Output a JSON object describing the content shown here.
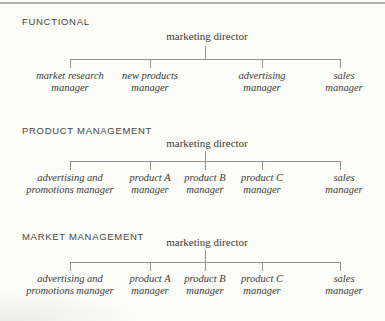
{
  "figure_title": "marketing department organization structures",
  "colors": {
    "background": "#fcfcf9",
    "line": "#94948c",
    "text": "#3b3b35",
    "heading_text": "#46463f",
    "top_rule": "#b0b0a9"
  },
  "charts": [
    {
      "heading": "FUNCTIONAL",
      "root": "marketing director",
      "branches": [
        {
          "lines": [
            "market research",
            "manager"
          ]
        },
        {
          "lines": [
            "new products",
            "manager"
          ]
        },
        {
          "lines": [
            "advertising",
            "manager"
          ]
        },
        {
          "lines": [
            "sales",
            "manager"
          ]
        }
      ]
    },
    {
      "heading": "PRODUCT MANAGEMENT",
      "root": "marketing director",
      "branches": [
        {
          "lines": [
            "advertising and",
            "promotions manager"
          ]
        },
        {
          "lines": [
            "product A",
            "manager"
          ]
        },
        {
          "lines": [
            "product B",
            "manager"
          ]
        },
        {
          "lines": [
            "product C",
            "manager"
          ]
        },
        {
          "lines": [
            "sales",
            "manager"
          ]
        }
      ]
    },
    {
      "heading": "MARKET MANAGEMENT",
      "root": "marketing director",
      "branches": [
        {
          "lines": [
            "advertising and",
            "promotions manager"
          ]
        },
        {
          "lines": [
            "product A",
            "manager"
          ]
        },
        {
          "lines": [
            "product B",
            "manager"
          ]
        },
        {
          "lines": [
            "product C",
            "manager"
          ]
        },
        {
          "lines": [
            "sales",
            "manager"
          ]
        }
      ]
    }
  ]
}
